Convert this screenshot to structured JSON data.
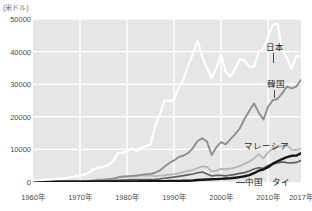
{
  "unit_label": "(米ドル)",
  "axis": {
    "y_ticks": [
      "0",
      "10000",
      "20000",
      "30000",
      "40000",
      "50000"
    ],
    "x_ticks": [
      "1960年",
      "1970年",
      "1980年",
      "1990年",
      "2000年",
      "2010年",
      "2017年"
    ]
  },
  "labels": {
    "japan": "日本",
    "korea": "韓国",
    "malaysia": "マレーシア",
    "china": "中国",
    "thailand": "タイ"
  },
  "colors": {
    "plot_background": "#e6e6e6",
    "gridline": "#ffffff",
    "japan": "#ffffff",
    "korea": "#8f8f8f",
    "malaysia": "#b5b5b5",
    "china": "#161616",
    "thailand": "#606060",
    "tick_text": "#4a4a4a",
    "unit_text": "#6a6a6a"
  },
  "chart_data": {
    "type": "line",
    "title": "",
    "subtitle": "",
    "xlabel": "",
    "ylabel": "(米ドル)",
    "xlim": [
      1960,
      2017
    ],
    "ylim": [
      0,
      50000
    ],
    "grid": true,
    "legend": "inline-right-labels",
    "x": [
      1960,
      1961,
      1962,
      1963,
      1964,
      1965,
      1966,
      1967,
      1968,
      1969,
      1970,
      1971,
      1972,
      1973,
      1974,
      1975,
      1976,
      1977,
      1978,
      1979,
      1980,
      1981,
      1982,
      1983,
      1984,
      1985,
      1986,
      1987,
      1988,
      1989,
      1990,
      1991,
      1992,
      1993,
      1994,
      1995,
      1996,
      1997,
      1998,
      1999,
      2000,
      2001,
      2002,
      2003,
      2004,
      2005,
      2006,
      2007,
      2008,
      2009,
      2010,
      2011,
      2012,
      2013,
      2014,
      2015,
      2016,
      2017
    ],
    "series": [
      {
        "name": "日本",
        "color": "#ffffff",
        "values": [
          479,
          563,
          633,
          717,
          835,
          920,
          1059,
          1232,
          1451,
          1669,
          2038,
          2273,
          2967,
          3975,
          4354,
          4659,
          5198,
          6335,
          8821,
          8897,
          9465,
          10213,
          9576,
          10428,
          10984,
          11586,
          17112,
          20745,
          25057,
          24814,
          25371,
          28915,
          31455,
          35766,
          39269,
          43440,
          38437,
          35022,
          31902,
          35022,
          39169,
          33846,
          32289,
          34808,
          37689,
          37218,
          35434,
          35275,
          39992,
          40855,
          44508,
          48168,
          48603,
          40454,
          38109,
          34524,
          38762,
          38428
        ]
      },
      {
        "name": "韓国",
        "color": "#8f8f8f",
        "values": [
          158,
          94,
          106,
          146,
          124,
          110,
          133,
          161,
          198,
          243,
          279,
          301,
          324,
          406,
          563,
          615,
          834,
          1049,
          1397,
          1734,
          1704,
          1870,
          1983,
          2199,
          2413,
          2482,
          2835,
          3554,
          4749,
          5818,
          6610,
          7637,
          8126,
          8884,
          10385,
          12565,
          13403,
          12398,
          8282,
          10672,
          12257,
          11561,
          13165,
          14673,
          16496,
          19403,
          21743,
          24086,
          21350,
          19144,
          23087,
          25096,
          25467,
          27183,
          29250,
          28732,
          29289,
          31363
        ]
      },
      {
        "name": "マレーシア",
        "color": "#b5b5b5",
        "values": [
          235,
          231,
          238,
          275,
          279,
          314,
          327,
          320,
          327,
          344,
          358,
          371,
          433,
          566,
          765,
          762,
          853,
          1001,
          1229,
          1505,
          1775,
          1769,
          1839,
          1937,
          2073,
          2000,
          1730,
          1943,
          2066,
          2289,
          2441,
          2654,
          3118,
          3427,
          3673,
          4297,
          4797,
          4638,
          3258,
          3493,
          4005,
          3913,
          4139,
          4434,
          4924,
          5554,
          6252,
          7243,
          8474,
          7292,
          9041,
          10399,
          10835,
          10971,
          11319,
          9955,
          9818,
          10259
        ]
      },
      {
        "name": "中国",
        "color": "#161616",
        "values": [
          89,
          75,
          70,
          74,
          85,
          98,
          104,
          96,
          91,
          100,
          113,
          118,
          131,
          157,
          160,
          178,
          165,
          185,
          156,
          184,
          194,
          197,
          203,
          225,
          250,
          294,
          282,
          251,
          283,
          310,
          317,
          333,
          366,
          377,
          473,
          609,
          709,
          781,
          828,
          873,
          959,
          1053,
          1148,
          1288,
          1508,
          1753,
          2099,
          2694,
          3468,
          3832,
          4550,
          5618,
          6316,
          7050,
          7651,
          8033,
          8079,
          8827
        ]
      },
      {
        "name": "タイ",
        "color": "#606060",
        "values": [
          101,
          106,
          113,
          118,
          126,
          136,
          155,
          165,
          173,
          184,
          192,
          196,
          211,
          257,
          315,
          350,
          382,
          439,
          518,
          591,
          683,
          729,
          733,
          753,
          765,
          750,
          830,
          968,
          1155,
          1320,
          1509,
          1711,
          1928,
          2179,
          2456,
          2847,
          3044,
          2468,
          1846,
          2032,
          2008,
          1893,
          2097,
          2358,
          2642,
          2894,
          3371,
          3973,
          4380,
          4213,
          5076,
          5492,
          5860,
          6171,
          5952,
          5840,
          5995,
          6595
        ]
      }
    ]
  }
}
